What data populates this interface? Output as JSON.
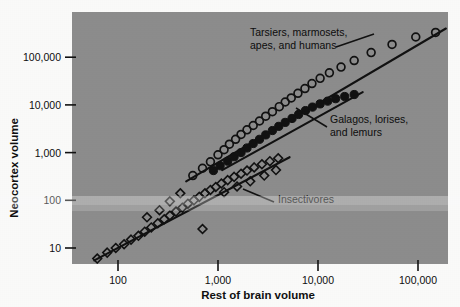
{
  "chart_data": {
    "type": "scatter",
    "title": "",
    "xlabel": "Rest of brain volume",
    "ylabel": "Neocortex volume",
    "xscale": "log",
    "yscale": "log",
    "xlim": [
      50,
      200000
    ],
    "ylim": [
      5,
      400000
    ],
    "grid": false,
    "legend_position": "none",
    "xticks": [
      100,
      1000,
      10000,
      100000
    ],
    "xtick_labels": [
      "100",
      "1,000",
      "10,000",
      "100,000"
    ],
    "yticks": [
      10,
      100,
      1000,
      10000,
      100000
    ],
    "ytick_labels": [
      "10",
      "100",
      "1,000",
      "10,000",
      "100,000"
    ],
    "panel_color": "#8e8e8e",
    "ink_color": "#121212",
    "series": [
      {
        "name": "Tarsiers, marmosets, apes, and humans",
        "marker": "open-circle",
        "points": [
          [
            560,
            330
          ],
          [
            700,
            470
          ],
          [
            840,
            640
          ],
          [
            1000,
            900
          ],
          [
            1150,
            1150
          ],
          [
            1300,
            1500
          ],
          [
            1500,
            1900
          ],
          [
            1700,
            2400
          ],
          [
            1950,
            3000
          ],
          [
            2250,
            3700
          ],
          [
            2600,
            4600
          ],
          [
            3000,
            5800
          ],
          [
            3500,
            7200
          ],
          [
            4100,
            9200
          ],
          [
            4700,
            11500
          ],
          [
            5400,
            14000
          ],
          [
            6300,
            17500
          ],
          [
            7400,
            22000
          ],
          [
            8700,
            28000
          ],
          [
            10500,
            36000
          ],
          [
            13000,
            47000
          ],
          [
            17000,
            62000
          ],
          [
            23000,
            85000
          ],
          [
            34000,
            125000
          ],
          [
            55000,
            185000
          ],
          [
            95000,
            265000
          ],
          [
            150000,
            330000
          ]
        ]
      },
      {
        "name": "Galagos, lorises, and lemurs",
        "marker": "filled-circle",
        "points": [
          [
            900,
            420
          ],
          [
            1050,
            530
          ],
          [
            1250,
            660
          ],
          [
            1450,
            820
          ],
          [
            1700,
            1000
          ],
          [
            1950,
            1250
          ],
          [
            2250,
            1550
          ],
          [
            2600,
            1900
          ],
          [
            3000,
            2350
          ],
          [
            3500,
            2900
          ],
          [
            4050,
            3550
          ],
          [
            4700,
            4300
          ],
          [
            5500,
            5200
          ],
          [
            6400,
            6300
          ],
          [
            7500,
            7600
          ],
          [
            8800,
            9000
          ],
          [
            10500,
            10500
          ],
          [
            12500,
            12000
          ],
          [
            15000,
            13500
          ],
          [
            18500,
            15000
          ],
          [
            23000,
            16500
          ]
        ]
      },
      {
        "name": "Insectivores",
        "marker": "open-diamond",
        "points": [
          [
            62,
            6
          ],
          [
            78,
            8
          ],
          [
            95,
            10
          ],
          [
            115,
            12
          ],
          [
            135,
            15
          ],
          [
            160,
            18
          ],
          [
            185,
            22
          ],
          [
            215,
            27
          ],
          [
            250,
            33
          ],
          [
            290,
            40
          ],
          [
            330,
            48
          ],
          [
            380,
            58
          ],
          [
            440,
            70
          ],
          [
            500,
            85
          ],
          [
            575,
            100
          ],
          [
            650,
            118
          ],
          [
            740,
            140
          ],
          [
            840,
            165
          ],
          [
            950,
            190
          ],
          [
            1080,
            225
          ],
          [
            1250,
            265
          ],
          [
            1450,
            310
          ],
          [
            1700,
            360
          ],
          [
            1950,
            420
          ],
          [
            2300,
            490
          ],
          [
            2750,
            570
          ],
          [
            3300,
            660
          ],
          [
            4000,
            760
          ],
          [
            700,
            25
          ],
          [
            420,
            140
          ],
          [
            330,
            95
          ],
          [
            260,
            62
          ],
          [
            195,
            44
          ],
          [
            1150,
            148
          ],
          [
            1550,
            195
          ],
          [
            2100,
            250
          ],
          [
            2900,
            330
          ],
          [
            3800,
            430
          ]
        ]
      }
    ],
    "regression_lines": [
      {
        "name": "primate-haplorhine-line",
        "x1": 480,
        "y1": 250,
        "x2": 190000,
        "y2": 400000
      },
      {
        "name": "strepsirrhine-line",
        "x1": 1100,
        "y1": 430,
        "x2": 28000,
        "y2": 18500
      },
      {
        "name": "insectivore-line",
        "x1": 58,
        "y1": 5.5,
        "x2": 5200,
        "y2": 800
      }
    ],
    "annotations": [
      {
        "name": "haplorhine-annotation",
        "text_line1": "Tarsiers, marmosets,",
        "text_line2": "apes, and humans",
        "text_x": 250,
        "text_y": 36,
        "leader_from_x": 336,
        "leader_from_y": 47,
        "leader_to_x": 374,
        "leader_to_y": 34
      },
      {
        "name": "strepsirrhine-annotation",
        "text_line1": "Galagos, lorises,",
        "text_line2": "and lemurs",
        "text_x": 330,
        "text_y": 123,
        "leader_from_x": 327,
        "leader_from_y": 127,
        "leader_to_x": 296,
        "leader_to_y": 108
      },
      {
        "name": "insectivore-annotation",
        "text_line1": "Insectivores",
        "text_line2": "",
        "text_x": 278,
        "text_y": 203,
        "leader_from_x": 274,
        "leader_from_y": 202,
        "leader_to_x": 243,
        "leader_to_y": 189
      }
    ]
  }
}
